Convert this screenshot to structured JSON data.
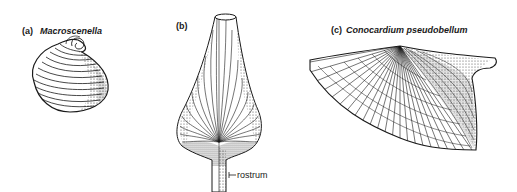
{
  "figure": {
    "panels": [
      {
        "id": "a",
        "tag": "(a)",
        "name": "Macroscenella"
      },
      {
        "id": "b",
        "tag": "(b)",
        "name": ""
      },
      {
        "id": "c",
        "tag": "(c)",
        "name": "Conocardium pseudobellum"
      }
    ],
    "annotations": {
      "rostrum": "rostrum"
    },
    "colors": {
      "ink": "#1a1a1a",
      "background": "#ffffff"
    }
  }
}
